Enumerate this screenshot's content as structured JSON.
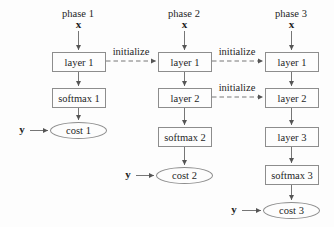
{
  "figure": {
    "background": "#fdfdfd",
    "line_color": "#666666",
    "box_border_color": "#8d8d8d",
    "text_color": "#1f1f1f",
    "phases": [
      {
        "label": "phase 1",
        "input": "x",
        "target": "y",
        "nodes": [
          "layer 1",
          "softmax 1"
        ],
        "cost": "cost 1"
      },
      {
        "label": "phase 2",
        "input": "x",
        "target": "y",
        "nodes": [
          "layer 1",
          "layer 2",
          "softmax 2"
        ],
        "cost": "cost 2"
      },
      {
        "label": "phase 3",
        "input": "x",
        "target": "y",
        "nodes": [
          "layer 1",
          "layer 2",
          "layer 3",
          "softmax 3"
        ],
        "cost": "cost 3"
      }
    ],
    "initialize_edges": [
      {
        "label": "initialize",
        "from": "phase 1 layer 1",
        "to": "phase 2 layer 1"
      },
      {
        "label": "initialize",
        "from": "phase 2 layer 1",
        "to": "phase 3 layer 1"
      },
      {
        "label": "initialize",
        "from": "phase 2 layer 2",
        "to": "phase 3 layer 2"
      }
    ]
  }
}
